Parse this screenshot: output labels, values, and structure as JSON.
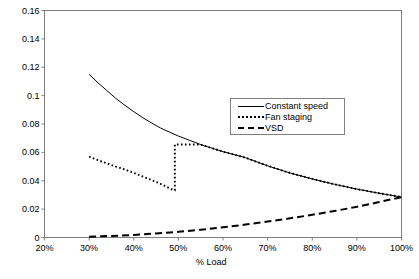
{
  "chart_data": {
    "type": "line",
    "title": "",
    "xlabel": "% Load",
    "ylabel": "",
    "xlim": [
      20,
      100
    ],
    "ylim": [
      0,
      0.16
    ],
    "grid": false,
    "legend_position": "inside-upper-right",
    "x_tick_labels": [
      "20%",
      "30%",
      "40%",
      "50%",
      "60%",
      "70%",
      "80%",
      "90%",
      "100%"
    ],
    "x_tick_values": [
      20,
      30,
      40,
      50,
      60,
      70,
      80,
      90,
      100
    ],
    "y_tick_labels": [
      "0",
      "0.02",
      "0.04",
      "0.06",
      "0.08",
      "0.1",
      "0.12",
      "0.14",
      "0.16"
    ],
    "y_tick_values": [
      0,
      0.02,
      0.04,
      0.06,
      0.08,
      0.1,
      0.12,
      0.14,
      0.16
    ],
    "series": [
      {
        "name": "Constant speed",
        "style": "solid",
        "color": "#000000",
        "x": [
          30,
          32,
          34,
          36,
          38,
          40,
          42,
          44,
          46,
          48,
          50,
          55,
          60,
          65,
          70,
          75,
          80,
          85,
          90,
          95,
          100
        ],
        "values": [
          0.115,
          0.109,
          0.1035,
          0.098,
          0.0932,
          0.0887,
          0.0845,
          0.0807,
          0.0772,
          0.0743,
          0.0715,
          0.0655,
          0.0605,
          0.0563,
          0.0505,
          0.0455,
          0.0413,
          0.0375,
          0.0341,
          0.0312,
          0.0285
        ]
      },
      {
        "name": "Fan staging",
        "style": "dotted",
        "color": "#000000",
        "x": [
          30,
          32,
          34,
          36,
          38,
          40,
          42,
          44,
          46,
          48,
          49,
          49.2,
          49.2,
          50,
          55,
          60,
          65,
          70,
          75,
          80,
          85,
          90,
          95,
          100
        ],
        "values": [
          0.057,
          0.0545,
          0.0522,
          0.05,
          0.048,
          0.0455,
          0.043,
          0.0405,
          0.0378,
          0.0348,
          0.0333,
          0.0333,
          0.0655,
          0.0655,
          0.0655,
          0.0605,
          0.0563,
          0.0505,
          0.0455,
          0.0413,
          0.0375,
          0.0341,
          0.0312,
          0.0285
        ]
      },
      {
        "name": "VSD",
        "style": "dashed",
        "color": "#000000",
        "x": [
          30,
          35,
          40,
          45,
          50,
          55,
          60,
          65,
          70,
          75,
          80,
          85,
          90,
          95,
          100
        ],
        "values": [
          0.0006,
          0.0011,
          0.0018,
          0.0028,
          0.004,
          0.0055,
          0.0072,
          0.0091,
          0.0112,
          0.0135,
          0.016,
          0.0187,
          0.0216,
          0.025,
          0.0285
        ]
      }
    ],
    "annotations": []
  },
  "legend": {
    "items": [
      {
        "label": "Constant speed",
        "style": "solid"
      },
      {
        "label": "Fan staging",
        "style": "dotted"
      },
      {
        "label": "VSD",
        "style": "dashed"
      }
    ]
  }
}
